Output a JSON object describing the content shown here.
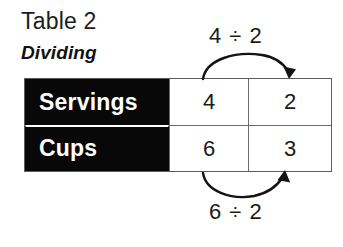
{
  "heading": {
    "title": "Table 2",
    "subtitle": "Dividing"
  },
  "table": {
    "rows": [
      {
        "header": "Servings",
        "values": [
          "4",
          "2"
        ]
      },
      {
        "header": "Cups",
        "values": [
          "6",
          "3"
        ]
      }
    ]
  },
  "annotations": {
    "top": {
      "expression": "4 ÷ 2",
      "direction": "left-to-right",
      "arrow": "curved-arrow-over-servings-row"
    },
    "bottom": {
      "expression": "6 ÷ 2",
      "direction": "left-to-right",
      "arrow": "curved-arrow-under-cups-row"
    }
  },
  "colors": {
    "header_background": "#080808",
    "header_text": "#ffffff",
    "body_text": "#1a1a1a",
    "grid_line": "#6b6b6b",
    "page_background": "#ffffff"
  }
}
